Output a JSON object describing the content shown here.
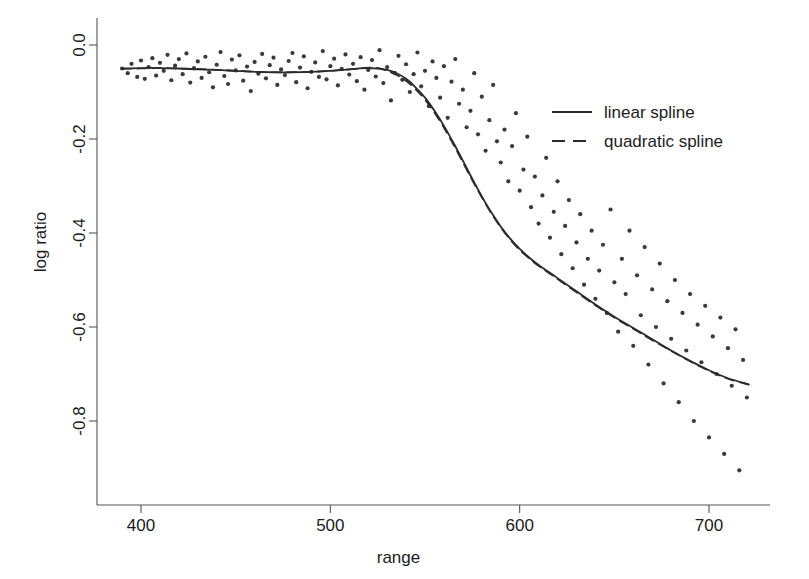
{
  "chart_data": {
    "type": "scatter",
    "title": "",
    "subtitle": "",
    "xlabel": "range",
    "ylabel": "log ratio",
    "xlim": [
      378,
      727
    ],
    "ylim": [
      -0.98,
      0.055
    ],
    "grid": false,
    "xticks": [
      400,
      500,
      600,
      700
    ],
    "xtick_labels": [
      "400",
      "500",
      "600",
      "700"
    ],
    "yticks": [
      0.0,
      -0.2,
      -0.4,
      -0.6,
      -0.8
    ],
    "ytick_labels": [
      "0.0",
      "-0.2",
      "-0.4",
      "-0.6",
      "-0.8"
    ],
    "legend_position": "upper right",
    "legend": [
      {
        "name": "linear spline",
        "style": "solid",
        "color": "#2b2b2b"
      },
      {
        "name": "quadratic spline",
        "style": "dashed",
        "color": "#2b2b2b"
      }
    ],
    "point_color": "#3a3a3a",
    "point_size": 2.1,
    "scatter": {
      "name": "observations",
      "x": [
        390,
        393,
        395,
        398,
        400,
        402,
        404,
        406,
        408,
        410,
        412,
        414,
        416,
        418,
        420,
        422,
        424,
        426,
        428,
        430,
        432,
        434,
        436,
        438,
        440,
        442,
        444,
        446,
        448,
        450,
        452,
        454,
        456,
        458,
        460,
        462,
        464,
        466,
        468,
        470,
        472,
        474,
        476,
        478,
        480,
        482,
        484,
        486,
        488,
        490,
        492,
        494,
        496,
        498,
        500,
        502,
        504,
        506,
        508,
        510,
        512,
        514,
        516,
        518,
        520,
        522,
        524,
        526,
        528,
        530,
        532,
        534,
        536,
        538,
        540,
        542,
        544,
        546,
        548,
        550,
        552,
        554,
        556,
        558,
        560,
        562,
        564,
        566,
        568,
        570,
        572,
        574,
        576,
        578,
        580,
        582,
        584,
        586,
        588,
        590,
        592,
        594,
        596,
        598,
        600,
        602,
        604,
        606,
        608,
        610,
        612,
        614,
        616,
        618,
        620,
        622,
        624,
        626,
        628,
        630,
        632,
        634,
        636,
        638,
        640,
        642,
        644,
        646,
        648,
        650,
        652,
        654,
        656,
        658,
        660,
        662,
        664,
        666,
        668,
        670,
        672,
        674,
        676,
        678,
        680,
        682,
        684,
        686,
        688,
        690,
        692,
        694,
        696,
        698,
        700,
        702,
        704,
        706,
        708,
        710,
        712,
        714,
        716,
        718,
        720
      ],
      "y": [
        -0.05,
        -0.06,
        -0.04,
        -0.068,
        -0.033,
        -0.072,
        -0.047,
        -0.028,
        -0.065,
        -0.038,
        -0.055,
        -0.021,
        -0.075,
        -0.044,
        -0.03,
        -0.062,
        -0.018,
        -0.08,
        -0.049,
        -0.035,
        -0.07,
        -0.025,
        -0.058,
        -0.09,
        -0.042,
        -0.015,
        -0.066,
        -0.083,
        -0.031,
        -0.054,
        -0.022,
        -0.076,
        -0.046,
        -0.098,
        -0.036,
        -0.061,
        -0.019,
        -0.071,
        -0.043,
        -0.027,
        -0.085,
        -0.052,
        -0.064,
        -0.034,
        -0.017,
        -0.079,
        -0.048,
        -0.024,
        -0.092,
        -0.057,
        -0.037,
        -0.068,
        -0.013,
        -0.073,
        -0.045,
        -0.029,
        -0.086,
        -0.051,
        -0.02,
        -0.063,
        -0.04,
        -0.077,
        -0.026,
        -0.095,
        -0.053,
        -0.032,
        -0.067,
        -0.011,
        -0.081,
        -0.047,
        -0.118,
        -0.059,
        -0.023,
        -0.074,
        -0.041,
        -0.1,
        -0.062,
        -0.016,
        -0.088,
        -0.055,
        -0.13,
        -0.035,
        -0.07,
        -0.112,
        -0.045,
        -0.155,
        -0.078,
        -0.03,
        -0.125,
        -0.095,
        -0.175,
        -0.14,
        -0.06,
        -0.19,
        -0.11,
        -0.225,
        -0.16,
        -0.085,
        -0.205,
        -0.25,
        -0.18,
        -0.29,
        -0.215,
        -0.145,
        -0.31,
        -0.265,
        -0.195,
        -0.345,
        -0.28,
        -0.38,
        -0.32,
        -0.24,
        -0.41,
        -0.355,
        -0.29,
        -0.445,
        -0.385,
        -0.33,
        -0.475,
        -0.42,
        -0.36,
        -0.51,
        -0.455,
        -0.395,
        -0.54,
        -0.48,
        -0.425,
        -0.57,
        -0.35,
        -0.505,
        -0.61,
        -0.455,
        -0.53,
        -0.395,
        -0.64,
        -0.49,
        -0.575,
        -0.43,
        -0.68,
        -0.52,
        -0.6,
        -0.465,
        -0.72,
        -0.545,
        -0.625,
        -0.5,
        -0.76,
        -0.57,
        -0.65,
        -0.53,
        -0.8,
        -0.595,
        -0.675,
        -0.555,
        -0.835,
        -0.62,
        -0.7,
        -0.58,
        -0.87,
        -0.645,
        -0.725,
        -0.605,
        -0.905,
        -0.67,
        -0.75,
        -0.63,
        -0.94,
        -0.695,
        -0.775,
        -0.655,
        -0.53,
        -0.82,
        -0.6,
        -0.48,
        -0.88,
        -0.56,
        -0.72,
        -0.46,
        -0.84,
        -0.62,
        -0.5,
        -0.78,
        -0.68,
        -0.56,
        -0.9,
        -0.64,
        -0.52,
        -0.82,
        -0.7,
        -0.6,
        -0.86,
        -0.54,
        -0.76,
        -0.66,
        -0.58,
        -0.92,
        -0.62,
        -0.7,
        -0.8,
        -0.64
      ]
    },
    "series": [
      {
        "name": "linear spline",
        "style": "solid",
        "x": [
          390,
          400,
          410,
          420,
          430,
          440,
          450,
          460,
          470,
          480,
          490,
          500,
          510,
          515,
          520,
          525,
          530,
          535,
          540,
          545,
          550,
          555,
          560,
          565,
          570,
          575,
          580,
          585,
          590,
          595,
          600,
          605,
          610,
          615,
          620,
          625,
          630,
          640,
          650,
          660,
          670,
          680,
          690,
          700,
          710,
          721
        ],
        "y": [
          -0.05,
          -0.049,
          -0.049,
          -0.05,
          -0.052,
          -0.053,
          -0.055,
          -0.057,
          -0.058,
          -0.058,
          -0.057,
          -0.055,
          -0.052,
          -0.05,
          -0.049,
          -0.05,
          -0.053,
          -0.06,
          -0.072,
          -0.09,
          -0.112,
          -0.14,
          -0.172,
          -0.208,
          -0.246,
          -0.285,
          -0.322,
          -0.356,
          -0.386,
          -0.412,
          -0.434,
          -0.452,
          -0.468,
          -0.482,
          -0.496,
          -0.51,
          -0.524,
          -0.552,
          -0.578,
          -0.602,
          -0.626,
          -0.65,
          -0.672,
          -0.692,
          -0.709,
          -0.722
        ]
      },
      {
        "name": "quadratic spline",
        "style": "dashed",
        "x": [
          390,
          400,
          410,
          420,
          430,
          440,
          450,
          460,
          470,
          480,
          490,
          500,
          510,
          515,
          520,
          525,
          530,
          535,
          540,
          545,
          550,
          555,
          560,
          565,
          570,
          575,
          580,
          585,
          590,
          595,
          600,
          605,
          610,
          615,
          620,
          625,
          630,
          640,
          650,
          660,
          670,
          680,
          690,
          700,
          710,
          721
        ],
        "y": [
          -0.051,
          -0.05,
          -0.049,
          -0.05,
          -0.051,
          -0.053,
          -0.055,
          -0.057,
          -0.058,
          -0.058,
          -0.057,
          -0.055,
          -0.052,
          -0.05,
          -0.048,
          -0.049,
          -0.055,
          -0.064,
          -0.076,
          -0.094,
          -0.116,
          -0.144,
          -0.176,
          -0.212,
          -0.25,
          -0.288,
          -0.324,
          -0.358,
          -0.388,
          -0.414,
          -0.436,
          -0.454,
          -0.47,
          -0.484,
          -0.498,
          -0.512,
          -0.526,
          -0.554,
          -0.58,
          -0.604,
          -0.628,
          -0.651,
          -0.673,
          -0.693,
          -0.71,
          -0.723
        ]
      }
    ]
  }
}
